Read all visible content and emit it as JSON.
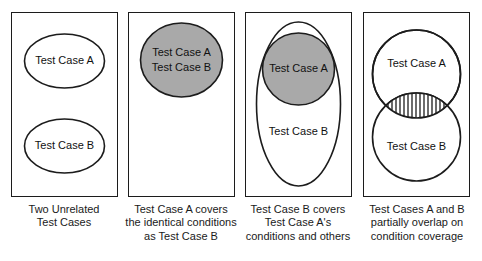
{
  "figure": {
    "colors": {
      "shape_fill_gray": "#a9a9a9",
      "shape_fill_white": "#ffffff",
      "stroke": "#1c1c1c",
      "text": "#1a1a1a",
      "background": "#ffffff"
    }
  },
  "panels": [
    {
      "id": "panel-unrelated",
      "caption": "Two Unrelated\nTest Cases",
      "shapes": [
        {
          "name": "ellipse-test-case-a",
          "label": "Test Case A",
          "fill": "white"
        },
        {
          "name": "ellipse-test-case-b",
          "label": "Test Case B",
          "fill": "white"
        }
      ]
    },
    {
      "id": "panel-identical",
      "caption": "Test Case A covers\nthe identical conditions\nas Test Case B",
      "shapes": [
        {
          "name": "ellipse-test-case-ab",
          "label_line_1": "Test Case A",
          "label_line_2": "Test Case B",
          "fill": "gray"
        }
      ]
    },
    {
      "id": "panel-subset",
      "caption": "Test Case B covers\nTest Case A's\nconditions and others",
      "shapes": [
        {
          "name": "ellipse-test-case-b-outer",
          "label": "Test Case B",
          "fill": "white"
        },
        {
          "name": "ellipse-test-case-a-inner",
          "label": "Test Case A",
          "fill": "gray"
        }
      ]
    },
    {
      "id": "panel-partial-overlap",
      "caption": "Test Cases A and B\npartially overlap on\ncondition coverage",
      "shapes": [
        {
          "name": "circle-test-case-a",
          "label": "Test Case A",
          "fill": "white"
        },
        {
          "name": "circle-test-case-b",
          "label": "Test Case B",
          "fill": "white"
        },
        {
          "name": "overlap-lens",
          "label": "",
          "fill": "hatched"
        }
      ]
    }
  ]
}
